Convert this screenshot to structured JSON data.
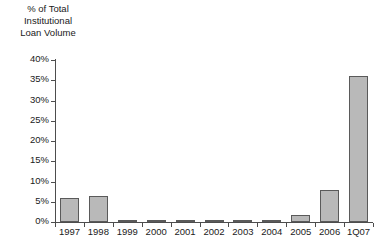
{
  "chart_data": {
    "type": "bar",
    "title": "",
    "xlabel": "",
    "ylabel": "% of Total Institutional Loan Volume",
    "ylabel_lines": [
      "% of Total",
      "Institutional",
      "Loan Volume"
    ],
    "categories": [
      "1997",
      "1998",
      "1999",
      "2000",
      "2001",
      "2002",
      "2003",
      "2004",
      "2005",
      "2006",
      "1Q07"
    ],
    "values": [
      6.0,
      6.4,
      0.4,
      0.6,
      0.1,
      0.1,
      0.5,
      0.2,
      1.7,
      7.8,
      36.0
    ],
    "ylim": [
      0,
      40
    ],
    "ytick_values": [
      0,
      5,
      10,
      15,
      20,
      25,
      30,
      35,
      40
    ],
    "ytick_labels": [
      "0%",
      "5%",
      "10%",
      "15%",
      "20%",
      "25%",
      "30%",
      "35%",
      "40%"
    ],
    "grid": false,
    "legend": false,
    "bar_color": "#b9b9b9",
    "bar_border_color": "#5a5a5a",
    "axis_color": "#4d4d4d",
    "text_color": "#1a1a1a",
    "background": "#ffffff"
  }
}
